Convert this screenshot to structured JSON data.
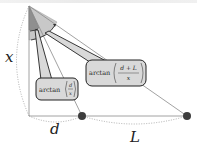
{
  "diagram": {
    "title": "",
    "labels": {
      "vertical": "x",
      "segment_near": "d",
      "segment_far": "L"
    },
    "callouts": [
      {
        "id": "near-angle",
        "prefix": "arctan",
        "numerator": "d",
        "denominator": "x"
      },
      {
        "id": "far-angle",
        "prefix": "arctan",
        "numerator": "d + L",
        "denominator": "x"
      }
    ],
    "points": [
      {
        "id": "apex",
        "x": 29,
        "y": 6
      },
      {
        "id": "foot",
        "x": 29,
        "y": 116
      },
      {
        "id": "near-dot",
        "x": 82,
        "y": 116
      },
      {
        "id": "far-dot",
        "x": 187,
        "y": 116
      }
    ],
    "colors": {
      "line": "#8a8a8a",
      "dark_line": "#333333",
      "dot": "#3d3d3d",
      "wedge_dark": "#8f8f8f",
      "wedge_light": "#c8c8c8",
      "callout_fill": "#d9d9d9",
      "callout_border": "#222222",
      "dotted_arc": "#9a9a9a"
    }
  }
}
